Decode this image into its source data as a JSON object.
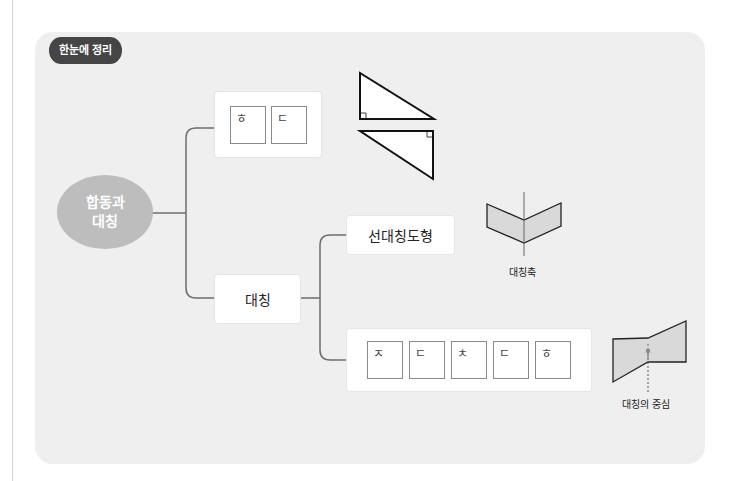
{
  "badge": {
    "label": "한눈에 정리"
  },
  "root": {
    "line1": "합동과",
    "line2": "대칭"
  },
  "branches": {
    "congruence_letters": [
      "ㅎ",
      "ㄷ"
    ],
    "symmetry": {
      "label": "대칭"
    },
    "line_symmetry": {
      "label": "선대칭도형",
      "caption": "대칭축"
    },
    "point_symmetry": {
      "letters": [
        "ㅈ",
        "ㄷ",
        "ㅊ",
        "ㄷ",
        "ㅎ"
      ],
      "caption": "대칭의 중심"
    }
  },
  "colors": {
    "panel": "#efefef",
    "badge": "#454545",
    "ellipse": "#bdbdbd",
    "shape_fill": "#d9d9d9",
    "connector": "#6e6e6e"
  }
}
